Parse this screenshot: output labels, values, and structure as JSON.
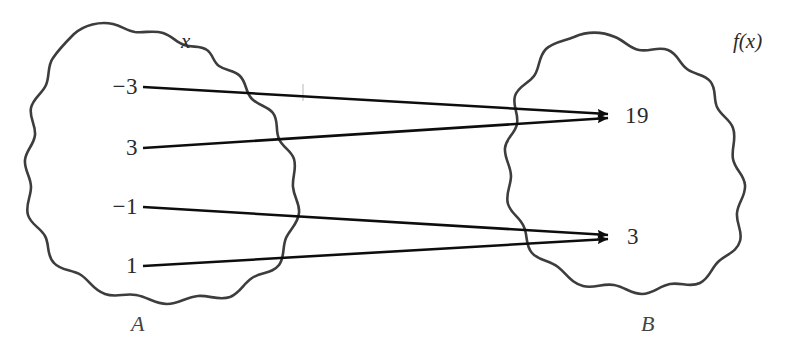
{
  "diagram": {
    "type": "function-mapping-diagram",
    "domain_set": {
      "name": "A",
      "variable_label": "x",
      "elements": [
        "−3",
        "3",
        "−1",
        "1"
      ]
    },
    "codomain_set": {
      "name": "B",
      "variable_label": "f(x)",
      "elements": [
        "19",
        "3"
      ]
    },
    "mappings": [
      {
        "from": "−3",
        "to": "19"
      },
      {
        "from": "3",
        "to": "19"
      },
      {
        "from": "−1",
        "to": "3"
      },
      {
        "from": "1",
        "to": "3"
      }
    ],
    "colors": {
      "ink": "#2b2b2b",
      "blob_stroke": "#3d3d3d",
      "arrow": "#0d0d0d",
      "background": "#ffffff"
    }
  }
}
